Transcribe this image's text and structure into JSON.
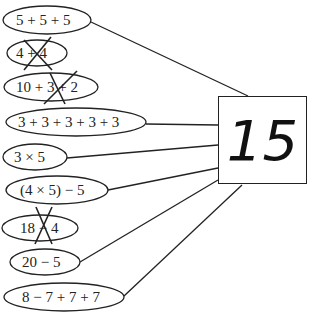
{
  "target": {
    "value": "15"
  },
  "expressions": [
    {
      "text": "5 + 5 + 5",
      "valid": true
    },
    {
      "text": "4 + 4",
      "valid": false
    },
    {
      "text": "10 + 3 + 2",
      "valid": false
    },
    {
      "text": "3 + 3 + 3 + 3 + 3",
      "valid": true
    },
    {
      "text": "3 × 5",
      "valid": true
    },
    {
      "text": "(4 × 5) − 5",
      "valid": true
    },
    {
      "text": "18 − 4",
      "valid": false
    },
    {
      "text": "20 − 5",
      "valid": true
    },
    {
      "text": "8 − 7 + 7 + 7",
      "valid": true
    }
  ],
  "colors": {
    "stroke": "#222222",
    "background": "#ffffff"
  }
}
